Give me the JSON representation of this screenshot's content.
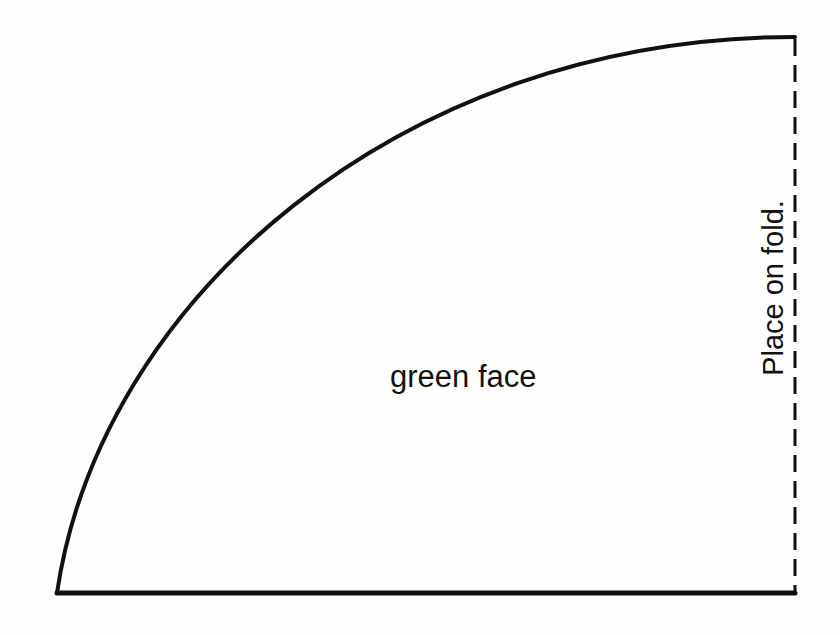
{
  "pattern": {
    "piece_label": "green face",
    "fold_instruction": "Place on fold.",
    "shape": "quarter-circle pattern piece",
    "stroke_color": "#111111",
    "background_color": "#fefefe"
  }
}
